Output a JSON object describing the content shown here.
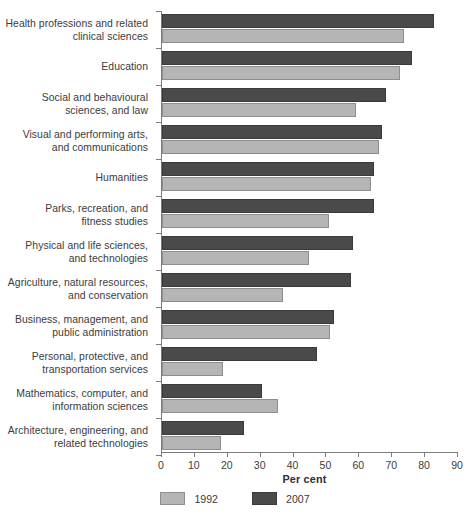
{
  "chart_data": {
    "type": "bar",
    "orientation": "horizontal",
    "title": "",
    "xlabel": "Per cent",
    "ylabel": "",
    "xlim": [
      0,
      90
    ],
    "xticks": [
      0,
      10,
      20,
      30,
      40,
      50,
      60,
      70,
      80,
      90
    ],
    "grid": false,
    "legend_position": "bottom-center",
    "categories": [
      "Health professions and related clinical sciences",
      "Education",
      "Social and behavioural sciences, and law",
      "Visual and performing arts, and communications",
      "Humanities",
      "Parks, recreation, and fitness studies",
      "Physical and life sciences, and technologies",
      "Agriculture, natural resources, and conservation",
      "Business, management, and public administration",
      "Personal, protective, and transportation services",
      "Mathematics, computer, and information sciences",
      "Architecture, engineering, and related technologies"
    ],
    "category_lines": [
      [
        "Health professions and related",
        "clinical sciences"
      ],
      [
        "Education"
      ],
      [
        "Social and behavioural",
        "sciences, and law"
      ],
      [
        "Visual and performing arts,",
        "and communications"
      ],
      [
        "Humanities"
      ],
      [
        "Parks, recreation, and",
        "fitness studies"
      ],
      [
        "Physical and life sciences,",
        "and technologies"
      ],
      [
        "Agriculture, natural resources,",
        "and conservation"
      ],
      [
        "Business, management, and",
        "public administration"
      ],
      [
        "Personal, protective, and",
        "transportation services"
      ],
      [
        "Mathematics, computer, and",
        "information sciences"
      ],
      [
        "Architecture, engineering, and",
        "related technologies"
      ]
    ],
    "series": [
      {
        "name": "1992",
        "color": "#b5b5b5",
        "values": [
          73.5,
          72.5,
          59.0,
          66.0,
          63.5,
          50.8,
          44.7,
          36.8,
          51.0,
          18.5,
          35.3,
          18.0
        ]
      },
      {
        "name": "2007",
        "color": "#4a4a4a",
        "values": [
          82.7,
          76.0,
          68.0,
          67.0,
          64.5,
          64.5,
          58.0,
          57.5,
          52.3,
          47.0,
          30.5,
          25.0
        ]
      }
    ]
  },
  "legend": {
    "items": [
      {
        "label": "1992",
        "swatch": "light"
      },
      {
        "label": "2007",
        "swatch": "dark"
      }
    ]
  },
  "axis": {
    "x_title": "Per cent",
    "tick_labels": [
      "0",
      "10",
      "20",
      "30",
      "40",
      "50",
      "60",
      "70",
      "80",
      "90"
    ]
  },
  "colors": {
    "series_1992": "#b5b5b5",
    "series_2007": "#4a4a4a",
    "axis": "#7c7c7c",
    "text": "#3b3b3b",
    "background": "#ffffff"
  }
}
